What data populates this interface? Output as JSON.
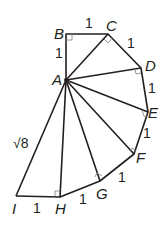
{
  "diagram": {
    "type": "square-root spiral (spiral of Theodorus)",
    "points": {
      "A": {
        "label": "A",
        "x": 66,
        "y": 80
      },
      "B": {
        "label": "B",
        "x": 66,
        "y": 34
      },
      "C": {
        "label": "C",
        "x": 108,
        "y": 34
      },
      "D": {
        "label": "D",
        "x": 141,
        "y": 68
      },
      "E": {
        "label": "E",
        "x": 148,
        "y": 112
      },
      "F": {
        "label": "F",
        "x": 134,
        "y": 154
      },
      "G": {
        "label": "G",
        "x": 100,
        "y": 181
      },
      "H": {
        "label": "H",
        "x": 60,
        "y": 197
      },
      "I": {
        "label": "I",
        "x": 16,
        "y": 196
      }
    },
    "edge_labels": {
      "AB": "1",
      "BC": "1",
      "CD": "1",
      "DE": "1",
      "EF": "1",
      "FG": "1",
      "GH": "1",
      "HI": "1",
      "AI": "√8"
    },
    "line_color": "#231f20",
    "right_angle_marker_color": "#999999"
  }
}
